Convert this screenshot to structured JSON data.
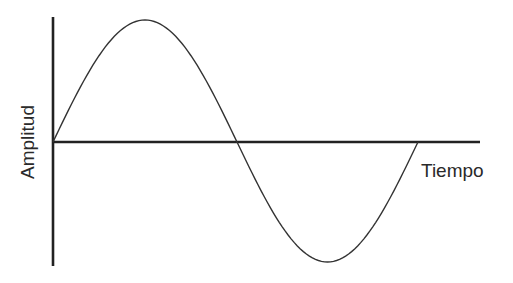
{
  "chart_data": {
    "type": "line",
    "title": "",
    "xlabel": "Tiempo",
    "ylabel": "Amplitud",
    "grid": false,
    "legend": null,
    "x": [
      0,
      0.25,
      0.5,
      0.75,
      1.0
    ],
    "x_units": "fraction of period",
    "values": [
      0,
      1,
      0,
      -1,
      0
    ],
    "xlim": [
      0,
      1.15
    ],
    "ylim": [
      -1.04,
      1.02
    ],
    "ticks": {
      "x": [],
      "y": []
    }
  },
  "colors": {
    "axis": "#222222",
    "wave": "#333333",
    "text": "#2a2a2a",
    "background": "#ffffff"
  },
  "geometry": {
    "origin": [
      53,
      142
    ],
    "y_axis": {
      "top": 17,
      "bottom": 266
    },
    "x_axis": {
      "left": 53,
      "right": 480
    },
    "wave_points": {
      "start": [
        53,
        142
      ],
      "peak": [
        148,
        20
      ],
      "mid_cross": [
        237,
        142
      ],
      "trough": [
        325,
        262
      ],
      "end": [
        418,
        142
      ]
    }
  }
}
